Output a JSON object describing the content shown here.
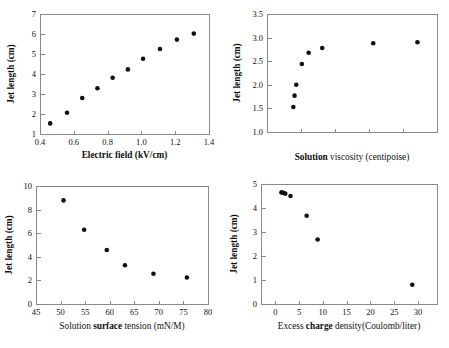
{
  "figure": {
    "title": "",
    "panel_count": 4,
    "marker_color": "#111111",
    "axis_color": "#8a8a8a"
  },
  "chart_data": [
    {
      "id": "electric-field",
      "type": "scatter",
      "title": "",
      "xlabel_parts": [
        {
          "text": "Electric field (kV/cm)",
          "bold": true
        }
      ],
      "xlabel": "Electric field (kV/cm)",
      "ylabel": "Jet length (cm)",
      "ylabel_bold": true,
      "xlim": [
        0.4,
        1.4
      ],
      "ylim": [
        1,
        7
      ],
      "xticks": [
        0.4,
        0.6,
        0.8,
        1.0,
        1.2,
        1.4
      ],
      "xticklabels": [
        "0.4",
        "0.6",
        "0.8",
        "1.0",
        "1.2",
        "1.4"
      ],
      "yticks": [
        1,
        2,
        3,
        4,
        5,
        6,
        7
      ],
      "yticklabels": [
        "1",
        "2",
        "3",
        "4",
        "5",
        "6",
        "7"
      ],
      "grid": false,
      "legend": null,
      "x": [
        0.46,
        0.56,
        0.65,
        0.74,
        0.83,
        0.92,
        1.01,
        1.11,
        1.21,
        1.31
      ],
      "y": [
        1.53,
        2.06,
        2.8,
        3.29,
        3.81,
        4.23,
        4.76,
        5.25,
        5.72,
        6.02
      ]
    },
    {
      "id": "solution-viscosity",
      "type": "scatter",
      "title": "",
      "xlabel_parts": [
        {
          "text": "Solution ",
          "bold": true
        },
        {
          "text": "viscosity (centipoise)",
          "bold": false
        }
      ],
      "xlabel": "Solution viscosity (centipoise)",
      "ylabel": "Jet length (cm)",
      "ylabel_bold": true,
      "xlim": [
        0,
        10
      ],
      "ylim": [
        1.0,
        3.5
      ],
      "xticks": [
        2,
        4,
        6,
        8
      ],
      "xticklabels": [
        "",
        "",
        "",
        ""
      ],
      "yticks": [
        1.0,
        1.5,
        2.0,
        2.5,
        3.0,
        3.5
      ],
      "yticklabels": [
        "1.0",
        "1.5",
        "2.0",
        "2.5",
        "3.0",
        "3.5"
      ],
      "grid": false,
      "legend": null,
      "x": [
        1.55,
        1.62,
        1.72,
        2.05,
        2.45,
        3.25,
        6.25,
        8.85
      ],
      "y": [
        1.53,
        1.77,
        2.0,
        2.44,
        2.68,
        2.78,
        2.88,
        2.9
      ]
    },
    {
      "id": "solution-surface-tension",
      "type": "scatter",
      "title": "",
      "xlabel_parts": [
        {
          "text": "Solution ",
          "bold": false
        },
        {
          "text": "surface",
          "bold": true
        },
        {
          "text": " tension (mN/M)",
          "bold": false
        }
      ],
      "xlabel": "Solution surface tension (mN/M)",
      "ylabel": "Jet length (cm)",
      "ylabel_bold": true,
      "xlim": [
        45,
        80
      ],
      "ylim": [
        0,
        10
      ],
      "xticks": [
        45,
        50,
        55,
        60,
        65,
        70,
        75,
        80
      ],
      "xticklabels": [
        "45",
        "50",
        "55",
        "60",
        "65",
        "70",
        "75",
        "80"
      ],
      "yticks": [
        0,
        2,
        4,
        6,
        8,
        10
      ],
      "yticklabels": [
        "0",
        "2",
        "4",
        "6",
        "8",
        "10"
      ],
      "grid": false,
      "legend": null,
      "x": [
        50.6,
        54.8,
        59.4,
        63.1,
        68.9,
        75.7
      ],
      "y": [
        8.78,
        6.29,
        4.58,
        3.29,
        2.56,
        2.25
      ]
    },
    {
      "id": "excess-charge-density",
      "type": "scatter",
      "title": "",
      "xlabel_parts": [
        {
          "text": "Excess ",
          "bold": false
        },
        {
          "text": "charge",
          "bold": true
        },
        {
          "text": " density(Coulomb/liter)",
          "bold": false
        }
      ],
      "xlabel": "Excess charge density(Coulomb/liter)",
      "ylabel": "Jet length (cm)",
      "ylabel_bold": true,
      "xlim": [
        -3,
        34
      ],
      "ylim": [
        0,
        5
      ],
      "xticks": [
        0,
        5,
        10,
        15,
        20,
        25,
        30
      ],
      "xticklabels": [
        "0",
        "5",
        "10",
        "15",
        "20",
        "25",
        "30"
      ],
      "yticks": [
        0,
        1,
        2,
        3,
        4,
        5
      ],
      "yticklabels": [
        "0",
        "1",
        "2",
        "3",
        "4",
        "5"
      ],
      "grid": false,
      "legend": null,
      "x": [
        1.3,
        1.7,
        2.1,
        3.2,
        6.6,
        8.9,
        28.8
      ],
      "y": [
        4.65,
        4.63,
        4.6,
        4.5,
        3.68,
        2.69,
        0.8
      ]
    }
  ]
}
